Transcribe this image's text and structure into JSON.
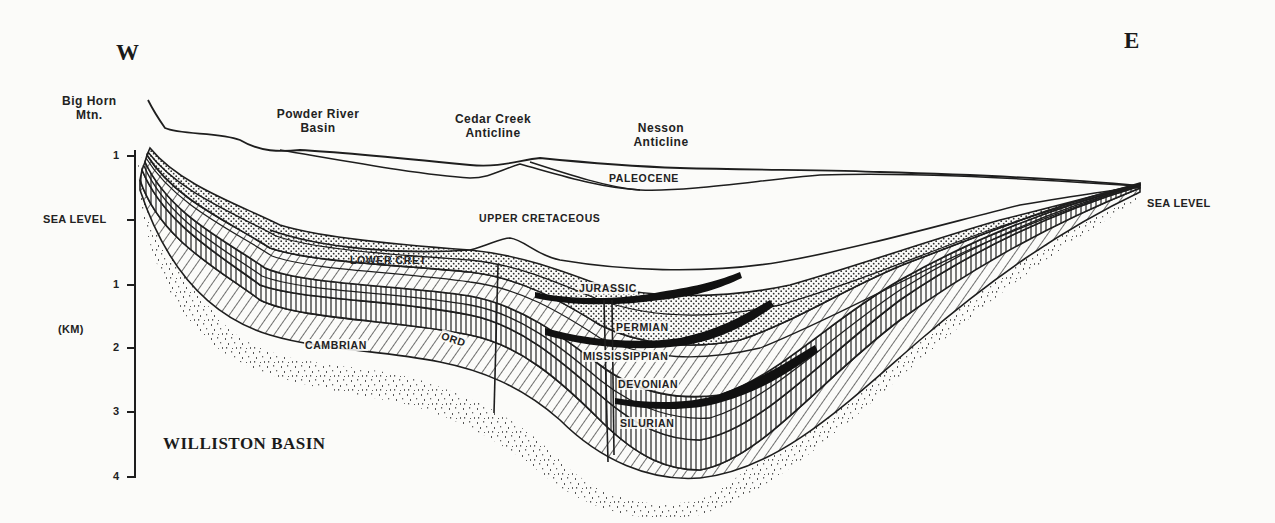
{
  "diagram": {
    "type": "geologic-cross-section",
    "title": "WILLISTON BASIN",
    "direction": {
      "west": "W",
      "east": "E"
    },
    "axis": {
      "unit_label": "(KM)",
      "ticks": [
        {
          "label": "1",
          "kind": "above"
        },
        {
          "label": "SEA LEVEL",
          "kind": "datum"
        },
        {
          "label": "1",
          "kind": "below"
        },
        {
          "label": "2",
          "kind": "below"
        },
        {
          "label": "3",
          "kind": "below"
        },
        {
          "label": "4",
          "kind": "below"
        }
      ]
    },
    "right_datum": "SEA LEVEL",
    "places": [
      {
        "line1": "Big Horn",
        "line2": "Mtn."
      },
      {
        "line1": "Powder River",
        "line2": "Basin"
      },
      {
        "line1": "Cedar  Creek",
        "line2": "Anticline"
      },
      {
        "line1": "Nesson",
        "line2": "Anticline"
      }
    ],
    "formations": [
      "PALEOCENE",
      "UPPER CRETACEOUS",
      "LOWER CRET",
      "JURASSIC",
      "PERMIAN",
      "MISSISSIPPIAN",
      "DEVONIAN",
      "SILURIAN",
      "ORD",
      "CAMBRIAN"
    ],
    "colors": {
      "ink": "#1e1e1e",
      "paper": "#fbfbf9",
      "label": "#222222"
    }
  }
}
